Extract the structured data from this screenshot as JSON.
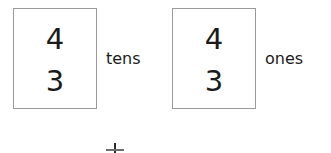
{
  "worksheet": {
    "type": "place-value-addition",
    "background_color": "#ffffff",
    "box_border_color": "#9a9a9a",
    "text_color": "#1b1b1b",
    "groups": [
      {
        "name": "tens",
        "label": "tens",
        "digits": {
          "top": "4",
          "bottom": "3"
        }
      },
      {
        "name": "ones",
        "label": "ones",
        "digits": {
          "top": "4",
          "bottom": "3"
        }
      }
    ],
    "operator": {
      "name": "plus",
      "symbol": "+"
    }
  }
}
